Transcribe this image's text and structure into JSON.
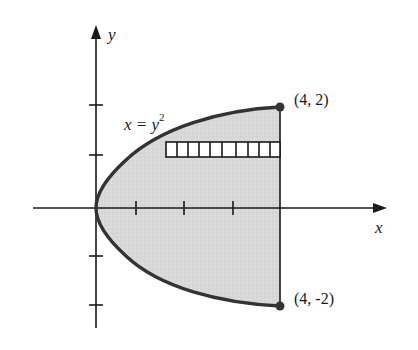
{
  "figure": {
    "colors": {
      "axis": "#1a1a1a",
      "curve": "#333333",
      "fill": "#d8d8d8",
      "strip_stroke": "#1a1a1a",
      "point": "#333333"
    }
  },
  "axes": {
    "x_label": "x",
    "y_label": "y",
    "x_ticks": [
      1,
      2,
      3,
      4
    ],
    "y_ticks": [
      -2,
      -1,
      1,
      2
    ]
  },
  "curve": {
    "equation_lhs": "x = y",
    "equation_exp": "2"
  },
  "points": [
    {
      "label": "(4, 2)",
      "x": 4,
      "y": 2
    },
    {
      "label": "(4, -2)",
      "x": 4,
      "y": -2
    }
  ],
  "strip": {
    "cells": 10,
    "y_from": 1.0,
    "y_to": 1.3,
    "x_from": 1.69,
    "x_to": 4
  }
}
